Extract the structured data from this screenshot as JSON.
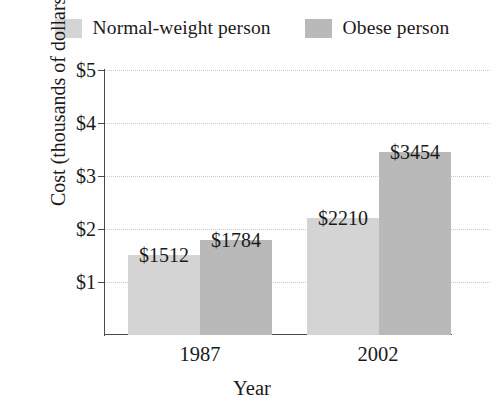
{
  "chart_data": {
    "type": "bar",
    "title": "",
    "xlabel": "Year",
    "ylabel": "Cost (thousands of dollars)",
    "categories": [
      "1987",
      "2002"
    ],
    "ylim": [
      0,
      5
    ],
    "yticks": [
      1,
      2,
      3,
      4,
      5
    ],
    "ytick_labels": [
      "$1",
      "$2",
      "$3",
      "$4",
      "$5"
    ],
    "grid": true,
    "legend_position": "top",
    "series": [
      {
        "name": "Normal-weight person",
        "color": "#d4d4d4",
        "values": [
          1.512,
          2.21
        ],
        "data_labels": [
          "$1512",
          "$2210"
        ]
      },
      {
        "name": "Obese person",
        "color": "#b9b9b9",
        "values": [
          1.784,
          3.454
        ],
        "data_labels": [
          "$1784",
          "$3454"
        ]
      }
    ]
  },
  "legend": {
    "entries": [
      {
        "label": "Normal-weight person",
        "swatch": "legend-swatch-normal-weight"
      },
      {
        "label": "Obese person",
        "swatch": "legend-swatch-obese"
      }
    ]
  },
  "axes": {
    "y_title": "Cost (thousands of dollars)",
    "x_title": "Year",
    "y_labels": [
      "$5",
      "$4",
      "$3",
      "$2",
      "$1"
    ],
    "x_labels": [
      "1987",
      "2002"
    ]
  },
  "bars": [
    {
      "name": "bar-1987-normal-weight",
      "label": "$1512"
    },
    {
      "name": "bar-1987-obese",
      "label": "$1784"
    },
    {
      "name": "bar-2002-normal-weight",
      "label": "$2210"
    },
    {
      "name": "bar-2002-obese",
      "label": "$3454"
    }
  ],
  "colors": {
    "series_light": "#d4d4d4",
    "series_dark": "#b9b9b9",
    "axis": "#4a4a4a",
    "grid": "#c9c9c9",
    "text": "#1a1a1a",
    "background": "#fefefe"
  }
}
